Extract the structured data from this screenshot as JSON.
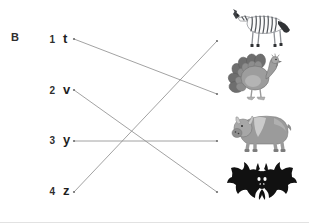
{
  "worksheet": {
    "section_label": "B",
    "width": 309,
    "height": 223,
    "background_color": "#ffffff",
    "line_color": "#8a8a8a",
    "text_color": "#1f1f1f"
  },
  "left_column": {
    "items": [
      {
        "number": "1",
        "letter": "t",
        "y": 40
      },
      {
        "number": "2",
        "letter": "v",
        "y": 91
      },
      {
        "number": "3",
        "letter": "y",
        "y": 141
      },
      {
        "number": "4",
        "letter": "z",
        "y": 192
      }
    ]
  },
  "right_column": {
    "items": [
      {
        "name": "zebra",
        "icon": "zebra-icon",
        "y": 14
      },
      {
        "name": "turkey",
        "icon": "turkey-icon",
        "y": 66
      },
      {
        "name": "yak",
        "icon": "yak-icon",
        "y": 118
      },
      {
        "name": "bat",
        "icon": "bat-icon",
        "y": 170
      }
    ]
  },
  "connections": [
    {
      "from_letter": "t",
      "to_animal": "turkey",
      "x1": 74,
      "y1": 39,
      "x2": 217,
      "y2": 94
    },
    {
      "from_letter": "v",
      "to_animal": "bat",
      "x1": 74,
      "y1": 90,
      "x2": 217,
      "y2": 192
    },
    {
      "from_letter": "y",
      "to_animal": "yak",
      "x1": 74,
      "y1": 141,
      "x2": 217,
      "y2": 141
    },
    {
      "from_letter": "z",
      "to_animal": "zebra",
      "x1": 74,
      "y1": 192,
      "x2": 217,
      "y2": 41
    }
  ],
  "palette": {
    "zebra_body": "#ffffff",
    "zebra_stripes": "#55585c",
    "turkey_body": "#9a9a9a",
    "turkey_tail": "#6f6f6f",
    "yak_body": "#9b9b9b",
    "yak_light": "#cfcfcf",
    "bat_body": "#111111"
  }
}
